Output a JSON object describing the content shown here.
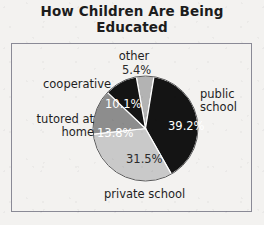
{
  "chart_data": {
    "type": "pie",
    "title": "How Children Are Being Educated",
    "title_line1": "How Children Are Being",
    "title_line2": "Educated",
    "xlabel": "",
    "ylabel": "",
    "legend": "none",
    "grid": false,
    "categories": [
      "public school",
      "private school",
      "tutored at home",
      "cooperative",
      "other"
    ],
    "values": [
      39.2,
      31.5,
      13.8,
      10.1,
      5.4
    ],
    "value_labels": [
      "39.2%",
      "31.5%",
      "13.8%",
      "10.1%",
      "5.4%"
    ],
    "colors": [
      "#141414",
      "#c9c9c9",
      "#8d8d8d",
      "#141414",
      "#b3b3b3"
    ],
    "slices": [
      {
        "name": "public school",
        "value": 39.2,
        "value_label": "39.2%",
        "color": "#141414",
        "label_line1": "public",
        "label_line2": "school"
      },
      {
        "name": "private school",
        "value": 31.5,
        "value_label": "31.5%",
        "color": "#c9c9c9",
        "label_line1": "private school",
        "label_line2": ""
      },
      {
        "name": "tutored at home",
        "value": 13.8,
        "value_label": "13.8%",
        "color": "#8d8d8d",
        "label_line1": "tutored at",
        "label_line2": "home"
      },
      {
        "name": "cooperative",
        "value": 10.1,
        "value_label": "10.1%",
        "color": "#141414",
        "label_line1": "cooperative",
        "label_line2": ""
      },
      {
        "name": "other",
        "value": 5.4,
        "value_label": "5.4%",
        "color": "#b3b3b3",
        "label_line1": "other",
        "label_line2": ""
      }
    ],
    "total": 100.0
  },
  "frame": {
    "border_color": "#8a8a96",
    "background": "#f3f2f0"
  }
}
